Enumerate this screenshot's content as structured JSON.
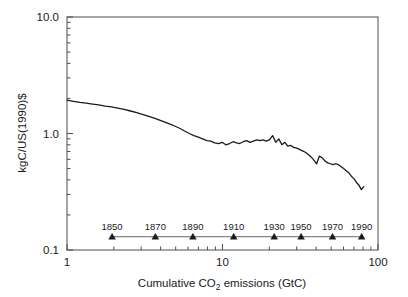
{
  "chart_data": {
    "type": "line",
    "title": "",
    "xlabel": "Cumulative CO2 emissions (GtC)",
    "xlabel_parts": {
      "pre": "Cumulative CO",
      "sub": "2",
      "post": " emissions (GtC)"
    },
    "ylabel": "kgC/US(1990)$",
    "xscale": "log",
    "yscale": "log",
    "xlim": [
      1,
      100
    ],
    "ylim": [
      0.1,
      10.0
    ],
    "xticks": [
      1,
      10,
      100
    ],
    "xticklabels": [
      "1",
      "10",
      "100"
    ],
    "yticks": [
      0.1,
      1.0,
      10.0
    ],
    "yticklabels": [
      "0.1",
      "1.0",
      "10.0"
    ],
    "grid": false,
    "legend": null,
    "series": [
      {
        "name": "Carbon intensity",
        "x": [
          1.0,
          1.1,
          1.21,
          1.33,
          1.46,
          1.6,
          1.76,
          1.93,
          2.12,
          2.33,
          2.56,
          2.81,
          3.05,
          3.32,
          3.6,
          3.9,
          4.22,
          4.56,
          4.92,
          5.3,
          5.7,
          6.12,
          6.55,
          7.0,
          7.45,
          7.92,
          8.4,
          8.9,
          9.42,
          9.95,
          10.5,
          11.1,
          11.7,
          12.3,
          12.9,
          13.6,
          14.3,
          15.0,
          15.8,
          16.6,
          17.4,
          18.2,
          19.1,
          20.0,
          21.0,
          22.0,
          23.0,
          24.1,
          25.2,
          26.3,
          27.5,
          28.7,
          30.0,
          31.3,
          32.7,
          34.1,
          35.6,
          37.1,
          38.7,
          40.3,
          42.0,
          43.8,
          45.6,
          47.5,
          49.4,
          51.4,
          53.5,
          55.6,
          57.8,
          60.1,
          62.5,
          64.9,
          67.4,
          70.0,
          72.7,
          75.4,
          78.2,
          81.0
        ],
        "y": [
          1.93,
          1.89,
          1.85,
          1.82,
          1.79,
          1.76,
          1.72,
          1.69,
          1.65,
          1.61,
          1.56,
          1.51,
          1.46,
          1.41,
          1.36,
          1.31,
          1.26,
          1.21,
          1.16,
          1.11,
          1.05,
          1.0,
          0.96,
          0.93,
          0.9,
          0.87,
          0.86,
          0.83,
          0.82,
          0.84,
          0.8,
          0.82,
          0.85,
          0.83,
          0.82,
          0.85,
          0.87,
          0.84,
          0.86,
          0.88,
          0.87,
          0.88,
          0.86,
          0.88,
          0.96,
          0.84,
          0.9,
          0.8,
          0.84,
          0.78,
          0.79,
          0.76,
          0.75,
          0.73,
          0.71,
          0.69,
          0.66,
          0.63,
          0.59,
          0.55,
          0.64,
          0.62,
          0.58,
          0.56,
          0.55,
          0.54,
          0.55,
          0.54,
          0.52,
          0.5,
          0.48,
          0.46,
          0.43,
          0.41,
          0.38,
          0.36,
          0.33,
          0.35
        ],
        "description": "Declining carbon intensity of the world economy versus cumulative emissions"
      }
    ],
    "annotations": {
      "name": "year-markers",
      "marker_shape": "triangle-up",
      "marker_y_value": 0.13,
      "points": [
        {
          "label": "1850",
          "x": 1.95
        },
        {
          "label": "1870",
          "x": 3.7
        },
        {
          "label": "1890",
          "x": 6.45
        },
        {
          "label": "1910",
          "x": 11.8
        },
        {
          "label": "1930",
          "x": 21.5
        },
        {
          "label": "1950",
          "x": 32.0
        },
        {
          "label": "1970",
          "x": 51.0
        },
        {
          "label": "1990",
          "x": 78.5
        }
      ]
    }
  },
  "colors": {
    "line": "#1a1a1a",
    "frame": "#4d4d4d",
    "text": "#1a1a1a",
    "background": "#ffffff",
    "marker": "#1a1a1a"
  }
}
